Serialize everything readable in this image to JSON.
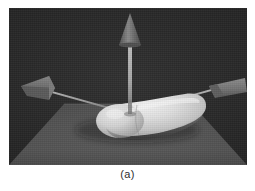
{
  "figure": {
    "caption": "(a)",
    "panel_label": "a",
    "scene_description": "3D rendered elongated ellipsoid resting on a perspective ground plane with three coordinate axis arrows",
    "colors": {
      "background": "#282828",
      "ground_plane": "#585858",
      "ground_plane_far": "#4a4a4a",
      "ground_plane_near": "#606060",
      "blob_highlight": "#f2f2f2",
      "blob_midtone": "#d2d2d2",
      "blob_shadow": "#9a9a9a",
      "arrow_shaft": "#b4b4b4",
      "arrow_head_light": "#8a8a8a",
      "arrow_head_dark": "#5a5a5a",
      "caption_text": "#2e2e2e",
      "page": "#ffffff"
    },
    "scene_objects": [
      {
        "name": "ground-plane",
        "type": "plane",
        "shade": "#585858"
      },
      {
        "name": "blob-ellipsoid",
        "type": "superquadric",
        "shade": "#e6e6e6"
      },
      {
        "name": "axis-arrow-up",
        "type": "arrow",
        "direction": "up",
        "shade": "#6e6e6e"
      },
      {
        "name": "axis-arrow-left",
        "type": "arrow",
        "direction": "left",
        "shade": "#767676"
      },
      {
        "name": "axis-arrow-right",
        "type": "arrow",
        "direction": "right",
        "shade": "#8c8c8c"
      }
    ]
  }
}
